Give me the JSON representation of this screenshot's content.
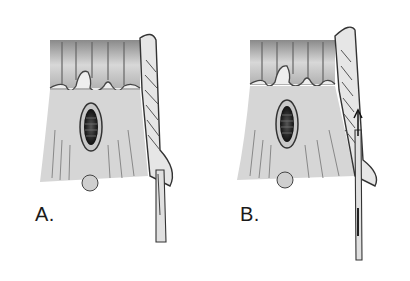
{
  "figure": {
    "panels": [
      {
        "id": "A",
        "label": "A.",
        "instrument": "scalpel-incision"
      },
      {
        "id": "B",
        "label": "B.",
        "instrument": "probe-with-arrow"
      }
    ],
    "colors": {
      "background": "#ffffff",
      "tissue_light": "#e2e2e2",
      "tissue_mid": "#a8a8a8",
      "tissue_dark": "#3a3a3a",
      "line": "#2a2a2a"
    }
  }
}
